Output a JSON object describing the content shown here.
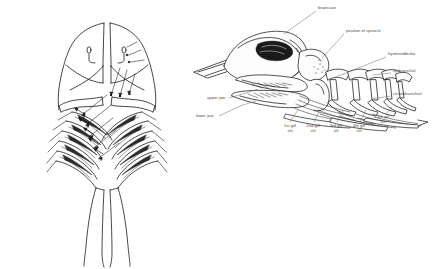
{
  "figure": {
    "title_text": "",
    "background_color": "#ffffff",
    "ink_color": "#1a1a1a",
    "label_color": "#4a4a4a",
    "left_panel": {
      "name": "ventral-dissection-of-pharynx-and-gills",
      "has_labels": false,
      "arrow_count": 11,
      "gill_filament_rows_left": 5,
      "gill_filament_rows_right": 5
    },
    "right_panel": {
      "name": "lateral-view-of-skull-jaws-and-branchial-arches",
      "labels": [
        {
          "id": "braincase",
          "text": "braincase",
          "x": 318,
          "y": 9,
          "align": "left"
        },
        {
          "id": "position-of-spiracle",
          "text": "position of spiracle",
          "x": 346,
          "y": 32,
          "align": "left"
        },
        {
          "id": "hyomandibular",
          "text": "hyomandibular",
          "x": 388,
          "y": 55,
          "align": "left"
        },
        {
          "id": "epibranchial",
          "text": "epibranchial",
          "x": 393,
          "y": 72,
          "align": "left"
        },
        {
          "id": "ceratobranchial",
          "text": "ceratobranchial",
          "x": 393,
          "y": 95,
          "align": "left"
        },
        {
          "id": "upper-jaw",
          "text": "upper jaw",
          "x": 207,
          "y": 99,
          "align": "left"
        },
        {
          "id": "lower-jaw",
          "text": "lower jaw",
          "x": 196,
          "y": 117,
          "align": "left"
        },
        {
          "id": "gill-slit-1",
          "text": "1st gill",
          "text2": "slit",
          "x": 289,
          "y": 127,
          "align": "center"
        },
        {
          "id": "gill-slit-2",
          "text": "2nd gill",
          "text2": "slit",
          "x": 313,
          "y": 127,
          "align": "center"
        },
        {
          "id": "gill-slit-3",
          "text": "3rd gill",
          "text2": "slit",
          "x": 336,
          "y": 127,
          "align": "center"
        },
        {
          "id": "gill-slit-4",
          "text": "4th gill",
          "text2": "slit",
          "x": 359,
          "y": 127,
          "align": "center"
        },
        {
          "id": "gill-slit-5",
          "text": "5th gill",
          "text2": "slit",
          "x": 383,
          "y": 118,
          "align": "center"
        }
      ]
    }
  }
}
